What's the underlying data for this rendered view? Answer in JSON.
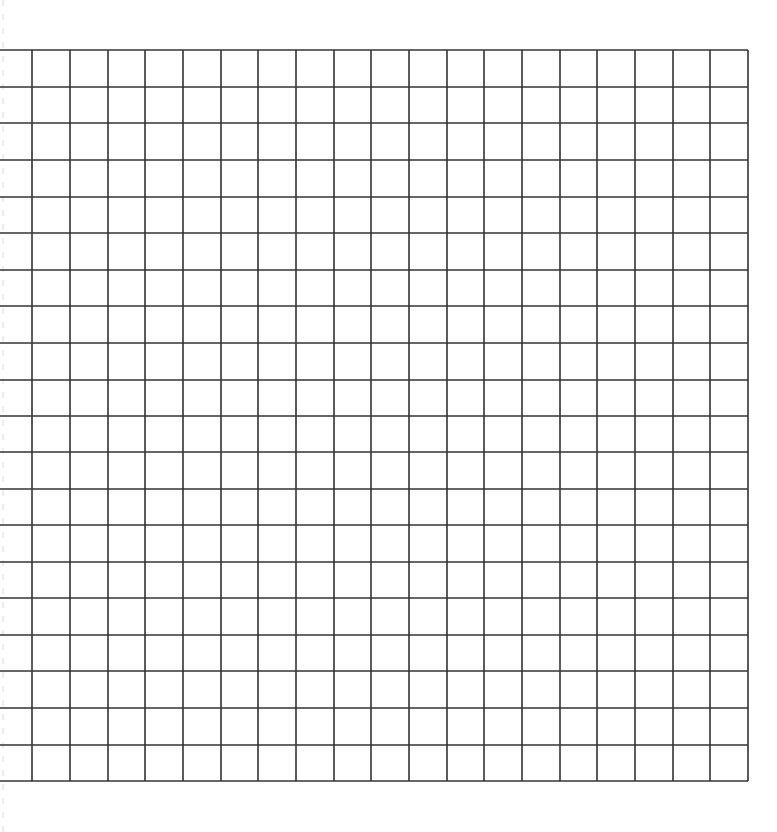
{
  "page": {
    "background": "#ffffff",
    "width": 777,
    "height": 832
  },
  "grid": {
    "line_color": "#333333",
    "line_width": 1.6,
    "top": 50,
    "bottom": 781,
    "left_open_edge": 0,
    "right": 748,
    "rows": 20,
    "columns_full": 20,
    "vertical_lines_x": [
      32,
      70,
      108,
      145,
      183,
      221,
      258,
      296,
      334,
      371,
      409,
      447,
      484,
      522,
      560,
      597,
      635,
      673,
      710,
      748
    ],
    "horizontal_lines_y": [
      50,
      87,
      123,
      160,
      197,
      233,
      270,
      306,
      343,
      380,
      416,
      452,
      489,
      525,
      562,
      598,
      635,
      671,
      708,
      745,
      781
    ]
  }
}
